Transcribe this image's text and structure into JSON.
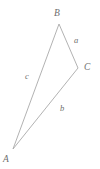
{
  "figure": {
    "name": "triangle-abc",
    "caption": "",
    "background_color": "#ffffff",
    "stroke_color": "#a9a9a9",
    "label_color": "#6e6e6e",
    "stroke_width": 0.9,
    "width": 100,
    "height": 169
  },
  "chart_data": {
    "type": "diagram",
    "subtype": "triangle",
    "title": "",
    "xlabel": "",
    "ylabel": "",
    "grid": false,
    "legend": null,
    "vertices": [
      {
        "id": "A",
        "label": "A",
        "x": 13,
        "y": 149,
        "label_x": 6,
        "label_y": 160
      },
      {
        "id": "B",
        "label": "B",
        "x": 59,
        "y": 24,
        "label_x": 57,
        "label_y": 14
      },
      {
        "id": "C",
        "label": "C",
        "x": 78,
        "y": 68,
        "label_x": 87,
        "label_y": 68
      }
    ],
    "edges": [
      {
        "id": "a",
        "label": "a",
        "from": "B",
        "to": "C",
        "label_x": 76,
        "label_y": 40
      },
      {
        "id": "b",
        "label": "b",
        "from": "A",
        "to": "C",
        "label_x": 62,
        "label_y": 108
      },
      {
        "id": "c",
        "label": "c",
        "from": "A",
        "to": "B",
        "label_x": 27,
        "label_y": 76
      }
    ],
    "path": "M 13 149 L 59 24 L 78 68 Z"
  },
  "labels": {
    "vertex_A": "A",
    "vertex_B": "B",
    "vertex_C": "C",
    "side_a": "a",
    "side_b": "b",
    "side_c": "c"
  }
}
